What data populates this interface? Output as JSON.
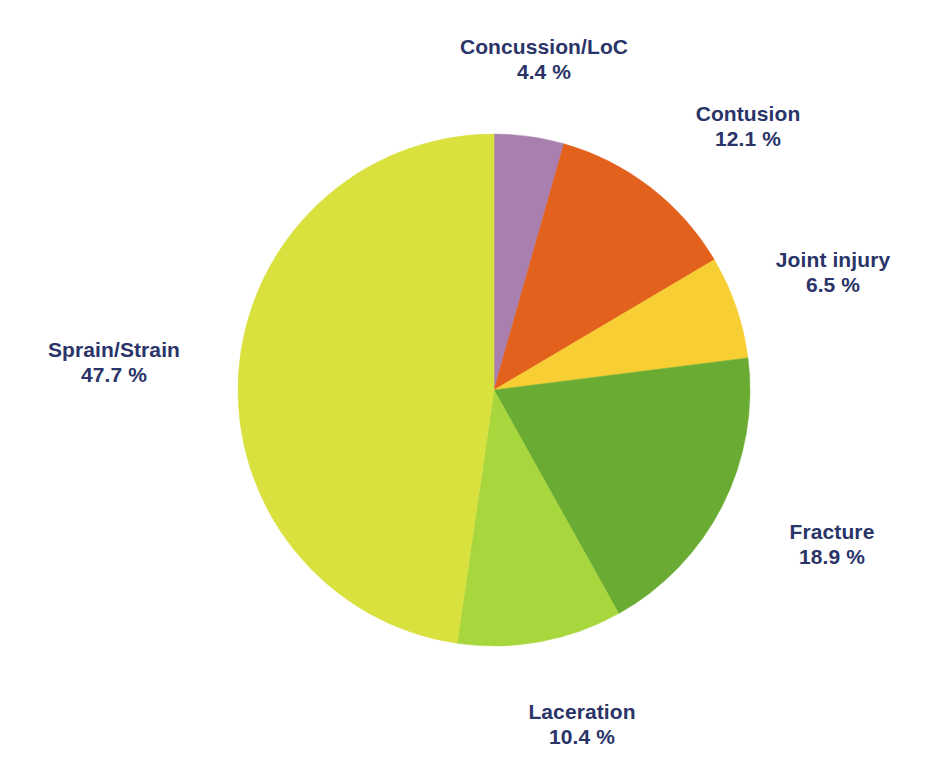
{
  "chart_data": {
    "type": "pie",
    "title": "",
    "subtitle": "",
    "xlabel": "",
    "ylabel": "",
    "legend_position": "none",
    "grid": false,
    "value_unit": "%",
    "value_suffix": " %",
    "total": 100.0,
    "start_angle_deg": 0,
    "direction": "clockwise",
    "categories": [
      "Concussion/LoC",
      "Contusion",
      "Joint injury",
      "Fracture",
      "Laceration",
      "Sprain/Strain"
    ],
    "values": [
      4.4,
      12.1,
      6.5,
      18.9,
      10.4,
      47.7
    ],
    "colors": [
      "#a87fae",
      "#e2611c",
      "#f7cf34",
      "#6aac33",
      "#a8d63d",
      "#d9e13f"
    ],
    "slices": [
      {
        "label": "Concussion/LoC",
        "value": 4.4,
        "value_text": "4.4 %",
        "color": "#a87fae",
        "color_name": "purple"
      },
      {
        "label": "Contusion",
        "value": 12.1,
        "value_text": "12.1 %",
        "color": "#e2611c",
        "color_name": "orange"
      },
      {
        "label": "Joint injury",
        "value": 6.5,
        "value_text": "6.5 %",
        "color": "#f7cf34",
        "color_name": "yellow"
      },
      {
        "label": "Fracture",
        "value": 18.9,
        "value_text": "18.9 %",
        "color": "#6aac33",
        "color_name": "green"
      },
      {
        "label": "Laceration",
        "value": 10.4,
        "value_text": "10.4 %",
        "color": "#a8d63d",
        "color_name": "light-green"
      },
      {
        "label": "Sprain/Strain",
        "value": 47.7,
        "value_text": "47.7 %",
        "color": "#d9e13f",
        "color_name": "chartreuse"
      }
    ]
  },
  "labels": {
    "concussion": {
      "name": "Concussion/LoC",
      "value": "4.4 %"
    },
    "contusion": {
      "name": "Contusion",
      "value": "12.1 %"
    },
    "joint": {
      "name": "Joint injury",
      "value": "6.5 %"
    },
    "fracture": {
      "name": "Fracture",
      "value": "18.9 %"
    },
    "laceration": {
      "name": "Laceration",
      "value": "10.4 %"
    },
    "sprain": {
      "name": "Sprain/Strain",
      "value": "47.7 %"
    }
  },
  "style": {
    "text_color": "#2a3468",
    "background": "#ffffff"
  },
  "geometry": {
    "center_x": 494,
    "center_y": 390,
    "radius": 256
  }
}
